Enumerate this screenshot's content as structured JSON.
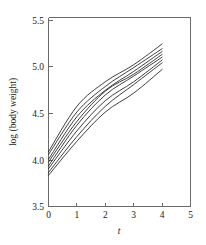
{
  "chart_data": {
    "type": "line",
    "title": "",
    "subtitle": "",
    "xlabel": "t",
    "ylabel": "log (body weight)",
    "xlim": [
      0,
      5
    ],
    "ylim": [
      3.5,
      5.5
    ],
    "x_ticks": [
      0,
      1,
      2,
      3,
      4,
      5
    ],
    "x_tick_labels": [
      "0",
      "1",
      "2",
      "3",
      "4",
      "5"
    ],
    "y_ticks": [
      3.5,
      4.0,
      4.5,
      5.0,
      5.5
    ],
    "y_tick_labels": [
      "3.5",
      "4.0",
      "4.5",
      "5.0",
      "5.5"
    ],
    "grid": false,
    "legend": false,
    "legend_position": "none",
    "line_color": "#1c1c1c",
    "axis_color": "#6b6b6b",
    "background_color": "#ffffff",
    "x": [
      0,
      1,
      2,
      3,
      4
    ],
    "series": [
      {
        "name": "subject-1",
        "values": [
          4.08,
          4.56,
          4.82,
          5.0,
          5.22
        ]
      },
      {
        "name": "subject-2",
        "values": [
          4.05,
          4.5,
          4.77,
          4.97,
          5.17
        ]
      },
      {
        "name": "subject-3",
        "values": [
          4.0,
          4.45,
          4.73,
          4.93,
          5.14
        ]
      },
      {
        "name": "subject-4",
        "values": [
          3.97,
          4.4,
          4.72,
          4.9,
          5.11
        ]
      },
      {
        "name": "subject-5",
        "values": [
          3.93,
          4.36,
          4.68,
          4.88,
          5.08
        ]
      },
      {
        "name": "subject-6",
        "values": [
          3.9,
          4.3,
          4.62,
          4.82,
          5.05
        ]
      },
      {
        "name": "subject-7",
        "values": [
          3.86,
          4.24,
          4.56,
          4.79,
          5.02
        ]
      },
      {
        "name": "subject-8",
        "values": [
          3.83,
          4.19,
          4.5,
          4.7,
          4.95
        ]
      }
    ]
  },
  "axes": {
    "y_title": "log (body weight)",
    "x_title": "t",
    "y_tick_0": "3.5",
    "y_tick_1": "4.0",
    "y_tick_2": "4.5",
    "y_tick_3": "5.0",
    "y_tick_4": "5.5",
    "x_tick_0": "0",
    "x_tick_1": "1",
    "x_tick_2": "2",
    "x_tick_3": "3",
    "x_tick_4": "4",
    "x_tick_5": "5"
  }
}
